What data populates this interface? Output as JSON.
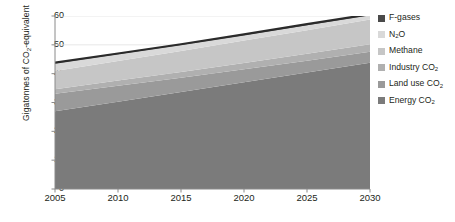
{
  "chart_data": {
    "type": "area",
    "stacked": true,
    "title": "",
    "subtitle": "",
    "xlabel": "",
    "ylabel": "Gigatonnes of CO2-equivalent",
    "ylabel_parts": {
      "pre": "Gigatonnes of CO",
      "sub": "2",
      "post": "-equivalent"
    },
    "x": [
      2005,
      2010,
      2015,
      2020,
      2025,
      2030
    ],
    "xlim": [
      2005,
      2030
    ],
    "ylim": [
      0,
      60
    ],
    "yticks": [
      0,
      10,
      20,
      30,
      40,
      50,
      60
    ],
    "xticks": [
      2005,
      2010,
      2015,
      2020,
      2025,
      2030
    ],
    "ytick_labels": [
      "0",
      "10",
      "20",
      "30",
      "40",
      "50",
      "60"
    ],
    "xtick_labels": [
      "2005",
      "2010",
      "2015",
      "2020",
      "2025",
      "2030"
    ],
    "grid": "horizontal-faint",
    "legend_position": "right",
    "total_outline": true,
    "totals": [
      43.8,
      47.0,
      50.2,
      53.6,
      57.2,
      60.6
    ],
    "series": [
      {
        "name": "Energy CO2",
        "label_pre": "Energy CO",
        "label_sub": "2",
        "color": "#7b7b7b",
        "values": [
          27.0,
          30.3,
          33.6,
          37.0,
          40.4,
          43.8
        ]
      },
      {
        "name": "Land use CO2",
        "label_pre": "Land use CO",
        "label_sub": "2",
        "color": "#9a9a9a",
        "values": [
          6.0,
          5.5,
          5.0,
          4.5,
          4.1,
          3.8
        ]
      },
      {
        "name": "Industry CO2",
        "label_pre": "Industry CO",
        "label_sub": "2",
        "color": "#b0b0b0",
        "values": [
          1.6,
          1.8,
          2.0,
          2.2,
          2.4,
          2.6
        ]
      },
      {
        "name": "Methane",
        "label_pre": "Methane",
        "label_sub": "",
        "color": "#c6c6c6",
        "values": [
          6.3,
          6.8,
          7.3,
          7.8,
          8.2,
          8.6
        ]
      },
      {
        "name": "N2O",
        "label_pre": "N",
        "label_sub": "2",
        "label_post": "O",
        "color": "#d9d9d9",
        "values": [
          2.6,
          2.3,
          2.0,
          1.8,
          1.7,
          1.5
        ]
      },
      {
        "name": "F-gases",
        "label_pre": "F-gases",
        "label_sub": "",
        "color": "#4a4a4a",
        "values": [
          0.3,
          0.3,
          0.3,
          0.3,
          0.4,
          0.3
        ]
      }
    ]
  },
  "legend": {
    "items": [
      {
        "label": "F-gases",
        "color": "#4a4a4a"
      },
      {
        "label": "N2O",
        "color": "#d9d9d9"
      },
      {
        "label": "Methane",
        "color": "#c6c6c6"
      },
      {
        "label": "Industry CO2",
        "color": "#b0b0b0"
      },
      {
        "label": "Land use CO2",
        "color": "#9a9a9a"
      },
      {
        "label": "Energy CO2",
        "color": "#7b7b7b"
      }
    ]
  },
  "axis": {
    "line_color": "#8a8a8a",
    "grid_color": "#e2e2e2",
    "outline_color": "#2b2b2b"
  }
}
